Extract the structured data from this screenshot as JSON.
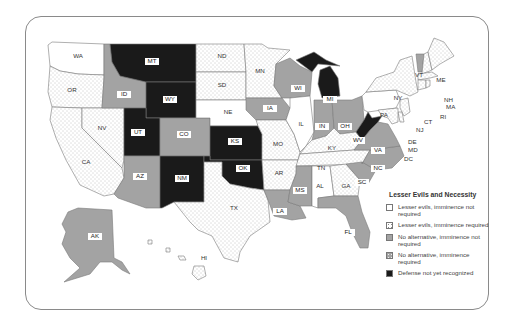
{
  "legend": {
    "title": "Lesser Evils and Necessity",
    "items": [
      {
        "key": "lesser_no_imm",
        "label": "Lesser evils, imminence not required",
        "color": "#ffffff",
        "pattern": "none"
      },
      {
        "key": "lesser_imm",
        "label": "Lesser evils, imminence required",
        "color": "#ffffff",
        "pattern": "dots"
      },
      {
        "key": "noalt_no_imm",
        "label": "No alternative, imminence not required",
        "color": "#a3a3a3",
        "pattern": "none"
      },
      {
        "key": "noalt_imm",
        "label": "No alternative, imminence required",
        "color": "#a3a3a3",
        "pattern": "dots"
      },
      {
        "key": "not_recognized",
        "label": "Defense not yet recognized",
        "color": "#1a1a1a",
        "pattern": "none"
      }
    ]
  },
  "states": {
    "WA": {
      "label": "WA",
      "category": "lesser_no_imm"
    },
    "OR": {
      "label": "OR",
      "category": "lesser_imm"
    },
    "CA": {
      "label": "CA",
      "category": "lesser_imm"
    },
    "NV": {
      "label": "NV",
      "category": "lesser_imm"
    },
    "ID": {
      "label": "ID",
      "category": "noalt_no_imm"
    },
    "MT": {
      "label": "MT",
      "category": "not_recognized"
    },
    "WY": {
      "label": "WY",
      "category": "not_recognized"
    },
    "UT": {
      "label": "UT",
      "category": "not_recognized"
    },
    "CO": {
      "label": "CO",
      "category": "noalt_no_imm"
    },
    "AZ": {
      "label": "AZ",
      "category": "noalt_no_imm"
    },
    "NM": {
      "label": "NM",
      "category": "not_recognized"
    },
    "ND": {
      "label": "ND",
      "category": "lesser_imm"
    },
    "SD": {
      "label": "SD",
      "category": "lesser_imm"
    },
    "NE": {
      "label": "NE",
      "category": "lesser_no_imm"
    },
    "KS": {
      "label": "KS",
      "category": "not_recognized"
    },
    "OK": {
      "label": "OK",
      "category": "not_recognized"
    },
    "TX": {
      "label": "TX",
      "category": "lesser_imm"
    },
    "MN": {
      "label": "MN",
      "category": "lesser_imm"
    },
    "IA": {
      "label": "IA",
      "category": "noalt_no_imm"
    },
    "MO": {
      "label": "MO",
      "category": "lesser_imm"
    },
    "AR": {
      "label": "AR",
      "category": "lesser_imm"
    },
    "LA": {
      "label": "LA",
      "category": "noalt_no_imm"
    },
    "WI": {
      "label": "WI",
      "category": "noalt_no_imm"
    },
    "IL": {
      "label": "IL",
      "category": "lesser_no_imm"
    },
    "MI": {
      "label": "MI",
      "category": "not_recognized"
    },
    "IN": {
      "label": "IN",
      "category": "noalt_no_imm"
    },
    "OH": {
      "label": "OH",
      "category": "noalt_no_imm"
    },
    "KY": {
      "label": "KY",
      "category": "lesser_imm"
    },
    "TN": {
      "label": "TN",
      "category": "lesser_imm"
    },
    "MS": {
      "label": "MS",
      "category": "noalt_no_imm"
    },
    "AL": {
      "label": "AL",
      "category": "lesser_no_imm"
    },
    "GA": {
      "label": "GA",
      "category": "lesser_imm"
    },
    "FL": {
      "label": "FL",
      "category": "noalt_no_imm"
    },
    "SC": {
      "label": "SC",
      "category": "noalt_no_imm"
    },
    "NC": {
      "label": "NC",
      "category": "noalt_no_imm"
    },
    "VA": {
      "label": "VA",
      "category": "noalt_no_imm"
    },
    "WV": {
      "label": "WV",
      "category": "not_recognized"
    },
    "PA": {
      "label": "PA",
      "category": "lesser_no_imm"
    },
    "NY": {
      "label": "NY",
      "category": "lesser_imm"
    },
    "VT": {
      "label": "VT",
      "category": "noalt_no_imm"
    },
    "NH": {
      "label": "NH",
      "category": "lesser_imm"
    },
    "ME": {
      "label": "ME",
      "category": "lesser_imm"
    },
    "MA": {
      "label": "MA",
      "category": "lesser_imm"
    },
    "RI": {
      "label": "RI",
      "category": "lesser_imm"
    },
    "CT": {
      "label": "CT",
      "category": "lesser_imm"
    },
    "NJ": {
      "label": "NJ",
      "category": "lesser_imm"
    },
    "DE": {
      "label": "DE",
      "category": "lesser_imm"
    },
    "MD": {
      "label": "MD",
      "category": "lesser_imm"
    },
    "DC": {
      "label": "DC",
      "category": "lesser_imm"
    },
    "AK": {
      "label": "AK",
      "category": "noalt_no_imm"
    },
    "HI": {
      "label": "HI",
      "category": "lesser_imm"
    }
  }
}
